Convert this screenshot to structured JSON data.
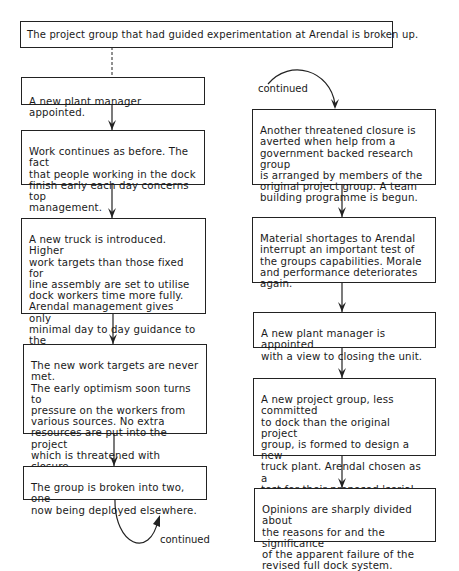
{
  "header": {
    "title": "The project group that had guided experimentation at Arendal is broken up."
  },
  "left_column": {
    "boxes": [
      {
        "text": "A new plant manager appointed."
      },
      {
        "text": "Work continues as before. The fact\nthat people working in the dock\nfinish early each day concerns top\nmanagement."
      },
      {
        "text": "A new truck is introduced. Higher\nwork targets than those fixed for\nline assembly are set to utilise\ndock workers time more fully.\nArendal management gives only\nminimal day to day guidance to the\nteam, the size of which is\ndoubled."
      },
      {
        "text": "The new work targets are never met.\nThe early optimism soon turns to\npressure on the workers from\nvarious sources.  No extra\nresources are put into the project\nwhich is threatened with closure.\nMorale slumps."
      },
      {
        "text": "The group is broken into two, one\nnow being deployed elsewhere."
      }
    ],
    "continued_label": "continued"
  },
  "right_column": {
    "continued_label": "continued",
    "boxes": [
      {
        "text": "Another threatened closure is\naverted when help from a\ngovernment backed research group\nis arranged by members of the\noriginal project group. A team\nbuilding programme is begun."
      },
      {
        "text": "Material shortages to Arendal\ninterrupt an important test of\nthe groups capabilities. Morale\nand performance deteriorates\nagain."
      },
      {
        "text": "A new plant manager is appointed\nwith a view to closing the unit."
      },
      {
        "text": "A new project group, less committed\nto dock than the original project\ngroup, is formed to design a new\ntruck plant.  Arendal chosen as a\ntest for their proposed 'serial\ndock' system."
      },
      {
        "text": "Opinions are sharply divided about\nthe reasons for and the significance\nof the apparent failure of the\nrevised full dock system."
      }
    ]
  }
}
